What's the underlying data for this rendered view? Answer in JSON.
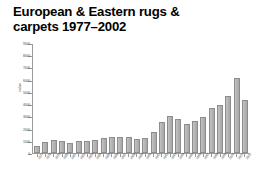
{
  "title": "European & Eastern rugs &\ncarpets 1977–2002",
  "chart_data": {
    "type": "bar",
    "title": "European & Eastern rugs & carpets 1977–2002",
    "xlabel": "",
    "ylabel": "value",
    "ylim": [
      0,
      9000
    ],
    "yticks": [
      0,
      1000,
      2000,
      3000,
      4000,
      5000,
      6000,
      7000,
      8000,
      9000
    ],
    "ytick_labels": [
      "0",
      "1000",
      "2000",
      "3000",
      "4000",
      "5000",
      "6000",
      "7000",
      "8000",
      "9000"
    ],
    "grid": false,
    "legend": false,
    "bar_color": "#b6b6b6",
    "bar_edge_color": "#8d8d8d",
    "categories": [
      "1977",
      "1978",
      "1979",
      "1980",
      "1981",
      "1982",
      "1983",
      "1984",
      "1985",
      "1986",
      "1987",
      "1988",
      "1989",
      "1990",
      "1991",
      "1992",
      "1993",
      "1994",
      "1995",
      "1996",
      "1997",
      "1998",
      "1999",
      "2000",
      "2001",
      "2002"
    ],
    "values": [
      600,
      900,
      1050,
      1020,
      850,
      980,
      980,
      1100,
      1200,
      1300,
      1350,
      1300,
      1180,
      1200,
      1750,
      2600,
      3050,
      2800,
      2400,
      2650,
      3000,
      3750,
      3950,
      4700,
      6200,
      4350
    ]
  },
  "colors": {
    "background": "#ffffff",
    "text": "#000000",
    "axis": "#9a9a9a",
    "tick_text": "#4a4a4a",
    "bar": "#b6b6b6"
  }
}
